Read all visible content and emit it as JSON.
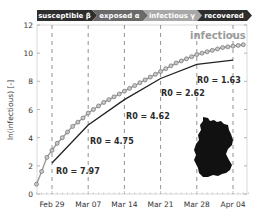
{
  "header": {
    "stages": [
      {
        "label": "susceptible β",
        "color": "#2e2e2e"
      },
      {
        "label": "exposed α",
        "color": "#6a6a6a"
      },
      {
        "label": "infectious γ",
        "color": "#a8a8a8"
      },
      {
        "label": "recovered",
        "color": "#2e2e2e"
      }
    ]
  },
  "chart_data": {
    "type": "line",
    "title": "",
    "xlabel": "",
    "ylabel": "ln(infectious) [-]",
    "ylim": [
      0,
      12
    ],
    "yticks": [
      0,
      2,
      4,
      6,
      8,
      10,
      12
    ],
    "xticks": [
      "Feb 29",
      "Mar 07",
      "Mar 14",
      "Mar 21",
      "Mar 28",
      "Apr 04"
    ],
    "grid": false,
    "vertical_dashed_lines_at": [
      "Feb 29",
      "Mar 07",
      "Mar 14",
      "Mar 21",
      "Mar 28",
      "Apr 04"
    ],
    "series": [
      {
        "name": "infectious",
        "style": "circle-markers",
        "color": "#8c8c8c",
        "x_day_offset_from_feb29": [
          -3,
          -2,
          -1,
          0,
          1,
          2,
          3,
          4,
          5,
          6,
          7,
          8,
          9,
          10,
          11,
          12,
          13,
          14,
          15,
          16,
          17,
          18,
          19,
          20,
          21,
          22,
          23,
          24,
          25,
          26,
          27,
          28,
          29,
          30,
          31,
          32,
          33,
          34,
          35,
          36,
          37
        ],
        "values": [
          0.7,
          1.6,
          2.6,
          3.1,
          3.6,
          4.0,
          4.4,
          4.8,
          5.1,
          5.4,
          5.75,
          6.0,
          6.25,
          6.5,
          6.7,
          6.9,
          7.1,
          7.3,
          7.5,
          7.7,
          7.9,
          8.1,
          8.3,
          8.5,
          8.7,
          8.9,
          9.1,
          9.3,
          9.45,
          9.6,
          9.75,
          9.9,
          10.0,
          10.1,
          10.2,
          10.3,
          10.4,
          10.45,
          10.5,
          10.55,
          10.6
        ]
      },
      {
        "name": "model fit (piecewise)",
        "style": "solid-line",
        "color": "#222222",
        "x_day_offset_from_feb29": [
          0,
          7,
          14,
          21,
          28,
          35
        ],
        "values": [
          2.2,
          4.9,
          6.7,
          8.2,
          9.2,
          9.5
        ]
      }
    ],
    "annotations": [
      {
        "text": "R0 = 7.97",
        "x": "Feb 29",
        "y": 1.6
      },
      {
        "text": "R0 = 4.75",
        "x": "Mar 07",
        "y": 3.7
      },
      {
        "text": "R0 = 4.62",
        "x": "Mar 14",
        "y": 5.5
      },
      {
        "text": "R0 = 2.62",
        "x": "Mar 21",
        "y": 7.3
      },
      {
        "text": "R0 = 1.63",
        "x": "Mar 28",
        "y": 8.2
      },
      {
        "text": "infectious",
        "x": "Mar 28",
        "y": 11.5
      }
    ],
    "inset": "silhouette-of-germany"
  },
  "labels": {
    "ylabel": "ln(infectious) [-]",
    "series_label": "infectious",
    "r0": [
      "R0 = 7.97",
      "R0 = 4.75",
      "R0 = 4.62",
      "R0 = 2.62",
      "R0 = 1.63"
    ]
  }
}
